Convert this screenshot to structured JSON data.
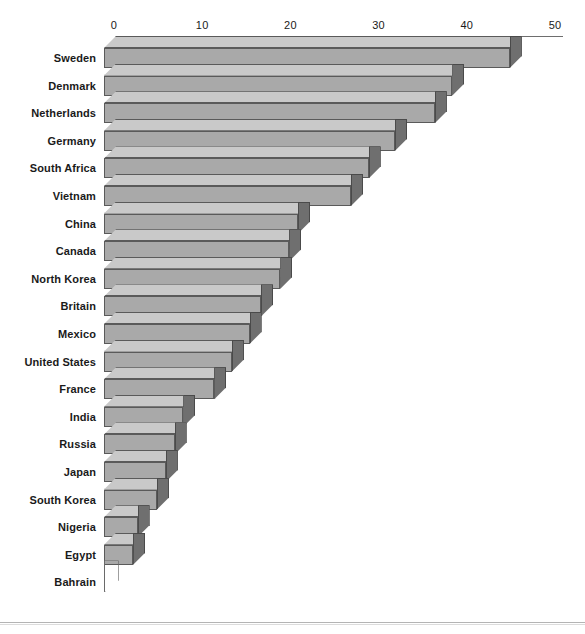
{
  "chart_data": {
    "type": "bar",
    "orientation": "horizontal",
    "style": "3d",
    "title": "",
    "subtitle": "",
    "xlabel": "",
    "ylabel": "",
    "xlim": [
      0,
      50
    ],
    "ylim": null,
    "grid": false,
    "legend": null,
    "legend_position": "none",
    "axis_position": "top",
    "tick_labels": [
      "0",
      "10",
      "20",
      "30",
      "40",
      "50"
    ],
    "ticks": [
      0,
      10,
      20,
      30,
      40,
      50
    ],
    "categories": [
      "Sweden",
      "Denmark",
      "Netherlands",
      "Germany",
      "South Africa",
      "Vietnam",
      "China",
      "Canada",
      "North Korea",
      "Britain",
      "Mexico",
      "United States",
      "France",
      "India",
      "Russia",
      "Japan",
      "South Korea",
      "Nigeria",
      "Egypt",
      "Bahrain"
    ],
    "values": [
      46,
      39.5,
      37.5,
      33,
      30,
      28,
      22,
      21,
      20,
      17.8,
      16.5,
      14.5,
      12.5,
      9,
      8,
      7,
      6,
      3.8,
      3.3,
      0.3
    ],
    "colors": {
      "bar_front": "#a9a9a9",
      "bar_top": "#c9c9c9",
      "bar_side": "#6f6f6f",
      "bar_edge": "#5a5a5a",
      "axis": "#6e6e6e",
      "text": "#1a1a1a",
      "background": "#ffffff",
      "frame_rule": "#b4b4b4"
    }
  }
}
